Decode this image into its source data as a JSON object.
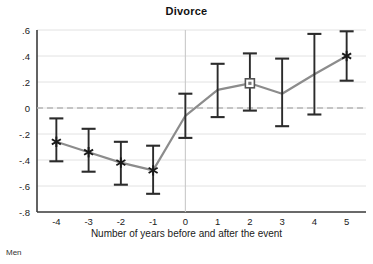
{
  "chart_data": {
    "type": "line",
    "title": "Divorce",
    "xlabel": "Number of years before and after the event",
    "ylabel": "",
    "x": [
      -4,
      -3,
      -2,
      -1,
      0,
      1,
      2,
      3,
      4,
      5
    ],
    "xticklabels": [
      "-4",
      "-3",
      "-2",
      "-1",
      "0",
      "1",
      "2",
      "3",
      "4",
      "5"
    ],
    "yticks": [
      0.6,
      0.4,
      0.2,
      0,
      -0.2,
      -0.4,
      -0.6,
      -0.8
    ],
    "yticklabels": [
      ".6",
      ".4",
      ".2",
      "0",
      "-.2",
      "-.4",
      "-.6",
      "-.8"
    ],
    "ylim": [
      -0.8,
      0.6
    ],
    "xlim": [
      -4.6,
      5.6
    ],
    "grid": true,
    "legend": null,
    "series": [
      {
        "name": "Estimate",
        "values": [
          -0.26,
          -0.34,
          -0.42,
          -0.48,
          -0.06,
          0.14,
          0.19,
          0.11,
          0.26,
          0.4
        ],
        "ci_low": [
          -0.41,
          -0.49,
          -0.59,
          -0.66,
          -0.23,
          -0.07,
          -0.02,
          -0.14,
          -0.05,
          0.21
        ],
        "ci_high": [
          -0.08,
          -0.16,
          -0.26,
          -0.29,
          0.11,
          0.34,
          0.42,
          0.38,
          0.57,
          0.59
        ],
        "markers": [
          "star",
          "star",
          "star",
          "star",
          "none",
          "none",
          "square",
          "none",
          "none",
          "star"
        ]
      }
    ],
    "reference_lines": [
      {
        "name": "zero-line",
        "orientation": "horizontal",
        "value": 0,
        "style": "dashed"
      },
      {
        "name": "event-line",
        "orientation": "vertical",
        "value": 0,
        "style": "solid"
      }
    ],
    "colors": {
      "line": "#8c8c8c",
      "error_bar": "#2b2b2b",
      "marker": "#1a1a1a",
      "grid": "#e2e2e2",
      "zero_line": "#b5b5b5",
      "event_line": "#c9c9c9",
      "axis": "#3c3c3c",
      "background": "#ffffff"
    }
  },
  "footer": {
    "note": "Men"
  }
}
